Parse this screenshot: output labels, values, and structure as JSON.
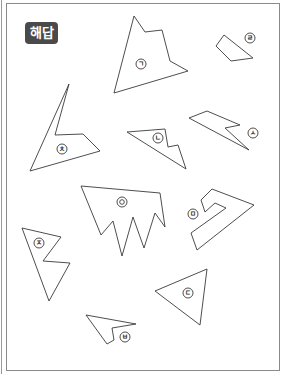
{
  "header": {
    "badge_label": "해답"
  },
  "pieces": [
    {
      "id": "giyeok",
      "label": "ㄱ"
    },
    {
      "id": "rieul",
      "label": "ㄹ"
    },
    {
      "id": "chieut",
      "label": "ㅊ"
    },
    {
      "id": "nieun",
      "label": "ㄴ"
    },
    {
      "id": "siot",
      "label": "ㅅ"
    },
    {
      "id": "ieung",
      "label": "ㅇ"
    },
    {
      "id": "mieum",
      "label": "ㅁ"
    },
    {
      "id": "jieut",
      "label": "ㅈ"
    },
    {
      "id": "digeut",
      "label": "ㄷ"
    },
    {
      "id": "bieup",
      "label": "ㅂ"
    }
  ],
  "colors": {
    "badge_bg": "#4a4a4a",
    "line": "#3a3a3a",
    "frame": "#8a8a8a"
  }
}
